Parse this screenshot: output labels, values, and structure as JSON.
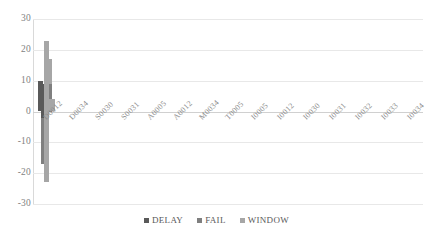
{
  "chart_data": {
    "type": "bar",
    "title": "",
    "xlabel": "",
    "ylabel": "",
    "ylim": [
      -30,
      30
    ],
    "ytick_values": [
      30,
      20,
      10,
      0,
      -10,
      -20,
      -30
    ],
    "ytick_labels": [
      "30",
      "20",
      "10",
      "0",
      "-10",
      "-20",
      "-30"
    ],
    "grid": true,
    "legend_position": "bottom",
    "categories": [
      "D0012",
      "D0034",
      "S0030",
      "S0031",
      "A0005",
      "A0012",
      "M0034",
      "T0005",
      "I0005",
      "I0012",
      "I0030",
      "I0031",
      "I0032",
      "I0033",
      "I0034"
    ],
    "series": [
      {
        "name": "DELAY",
        "color": "#595959",
        "values": [
          -3,
          0,
          0,
          0,
          9,
          -2,
          0,
          9,
          9,
          10,
          2,
          -2,
          0,
          0,
          0
        ]
      },
      {
        "name": "FAIL",
        "color": "#7f7f7f",
        "values": [
          4,
          -17,
          0,
          -15,
          9,
          0,
          0,
          9,
          9,
          6,
          2,
          0,
          0,
          0,
          0
        ]
      },
      {
        "name": "WINDOW",
        "color": "#a6a6a6",
        "values": [
          0,
          17,
          0,
          15,
          0,
          4,
          23,
          0,
          0,
          4,
          0,
          4,
          18,
          10,
          16
        ]
      },
      {
        "name": "WINDOW_NEG",
        "color": "#a6a6a6",
        "values": [
          0,
          0,
          0,
          0,
          0,
          0,
          -23,
          0,
          0,
          0,
          0,
          0,
          -18,
          -10,
          -16
        ]
      }
    ]
  },
  "legend": {
    "items": [
      {
        "label": "DELAY",
        "color": "#595959"
      },
      {
        "label": "FAIL",
        "color": "#7f7f7f"
      },
      {
        "label": "WINDOW",
        "color": "#a6a6a6"
      }
    ]
  }
}
